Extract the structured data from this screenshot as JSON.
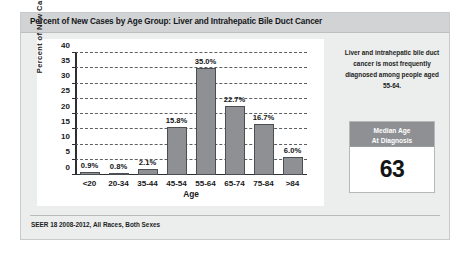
{
  "header": {
    "title": "Percent of New Cases by Age Group: Liver and Intrahepatic Bile Duct Cancer"
  },
  "side_note": {
    "text": "Liver and intrahepatic bile duct cancer is most frequently diagnosed among people aged 55-64."
  },
  "median_box": {
    "label_line1": "Median Age",
    "label_line2": "At Diagnosis",
    "value": "63"
  },
  "footer": {
    "source": "SEER 18 2008-2012, All Races, Both Sexes"
  },
  "colors": {
    "panel_background": "#eceded",
    "header_band": "#d2d3d4",
    "plot_background": "#ffffff",
    "bar_fill": "#8e9094",
    "bar_edge": "#4b4e52",
    "axis": "#2c2f33",
    "gridline": "#5c5f63",
    "median_header": "#8e9094",
    "text": "#18191b"
  },
  "chart_data": {
    "type": "bar",
    "title": "Percent of New Cases by Age Group: Liver and Intrahepatic Bile Duct Cancer",
    "xlabel": "Age",
    "ylabel": "Percent of New Cases",
    "categories": [
      "<20",
      "20-34",
      "35-44",
      "45-54",
      "55-64",
      "65-74",
      "75-84",
      ">84"
    ],
    "values": [
      0.9,
      0.8,
      2.1,
      15.8,
      35.0,
      22.7,
      16.7,
      6.0
    ],
    "data_labels": [
      "0.9%",
      "0.8%",
      "2.1%",
      "15.8%",
      "35.0%",
      "22.7%",
      "16.7%",
      "6.0%"
    ],
    "ylim": [
      0,
      40
    ],
    "yticks": [
      0,
      5,
      10,
      15,
      20,
      25,
      30,
      35,
      40
    ],
    "ytick_labels": [
      "0",
      "5",
      "10",
      "15",
      "20",
      "25",
      "30",
      "35",
      "40"
    ],
    "grid": true,
    "grid_style": "dashed horizontal",
    "legend": "none",
    "source_note": "SEER 18 2008-2012, All Races, Both Sexes",
    "annotation": "Liver and intrahepatic bile duct cancer is most frequently diagnosed among people aged 55-64.",
    "median_age_at_diagnosis": 63
  }
}
